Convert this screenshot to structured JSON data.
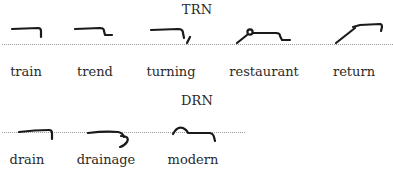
{
  "sections": [
    {
      "heading": "TRN",
      "words": [
        {
          "label": "train",
          "outline": "train-outline"
        },
        {
          "label": "trend",
          "outline": "trend-outline"
        },
        {
          "label": "turning",
          "outline": "turning-outline"
        },
        {
          "label": "restaurant",
          "outline": "restaurant-outline"
        },
        {
          "label": "return",
          "outline": "return-outline"
        }
      ]
    },
    {
      "heading": "DRN",
      "words": [
        {
          "label": "drain",
          "outline": "drain-outline"
        },
        {
          "label": "drainage",
          "outline": "drainage-outline"
        },
        {
          "label": "modern",
          "outline": "modern-outline"
        }
      ]
    }
  ],
  "colors": {
    "ink": "#1a1a1a",
    "text": "#2a2a2a",
    "baseline_dots": "#9a9a9a",
    "background": "#ffffff"
  }
}
